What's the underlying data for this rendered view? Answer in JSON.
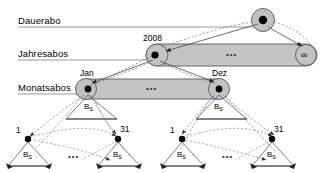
{
  "figure": {
    "levels": [
      {
        "id": "dauerabo",
        "label": "Dauerabo"
      },
      {
        "id": "jahresabos",
        "label": "Jahresabos"
      },
      {
        "id": "monatsabos",
        "label": "Monatsabos"
      }
    ],
    "nodes": {
      "root": {
        "label": ""
      },
      "year_first": {
        "label": "2008"
      },
      "year_last": {
        "label": "∞"
      },
      "month_first": {
        "label": "Jan"
      },
      "month_last": {
        "label": "Dez"
      },
      "day_first_left": {
        "label": "1"
      },
      "day_last_left": {
        "label": "31"
      },
      "day_first_right": {
        "label": "1"
      },
      "day_last_right": {
        "label": "31"
      }
    },
    "triangles": {
      "bs_label_base": "B",
      "bs_label_sub": "S"
    },
    "ellipsis": "•••",
    "colors": {
      "ellipse_fill": "#c0c0c0",
      "ellipse_stroke": "#555555",
      "node_fill": "#000000",
      "circle_fill": "#bfbfbf",
      "solid_edge": "#444444",
      "dashed_edge": "#777777",
      "baseline": "#888888",
      "triangle_stroke": "#555555"
    }
  }
}
